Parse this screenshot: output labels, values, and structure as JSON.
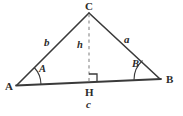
{
  "figure": {
    "stroke_color": "#3a3a3a",
    "dash_color": "#8a8a8a",
    "text_color": "#2b2b2b",
    "background": "#ffffff",
    "vertices": [
      {
        "name": "A",
        "label": "A",
        "x": 17,
        "y": 85
      },
      {
        "name": "C",
        "label": "C",
        "x": 89,
        "y": 13
      },
      {
        "name": "B",
        "label": "B",
        "x": 160,
        "y": 79
      },
      {
        "name": "H",
        "label": "H",
        "x": 89,
        "y": 83
      }
    ],
    "sides": [
      {
        "name": "side-b",
        "label": "b",
        "from": "A",
        "to": "C",
        "label_x": 46,
        "label_y": 43
      },
      {
        "name": "side-a",
        "label": "a",
        "from": "C",
        "to": "B",
        "label_x": 126,
        "label_y": 40
      },
      {
        "name": "side-c",
        "label": "c",
        "from": "A",
        "to": "B",
        "label_x": 87,
        "label_y": 103
      }
    ],
    "altitude": {
      "name": "altitude-h",
      "label": "h",
      "from": "C",
      "to": "H",
      "style": "dashed",
      "label_x": 79,
      "label_y": 45
    },
    "angles": [
      {
        "name": "angle-A",
        "label": "A",
        "at": "A",
        "label_x": 41,
        "label_y": 70
      },
      {
        "name": "angle-B",
        "label": "B",
        "at": "B",
        "label_x": 134,
        "label_y": 65
      }
    ],
    "right_angle": {
      "name": "right-angle-marker",
      "at": "H",
      "label": ""
    },
    "vertex_label_positions": {
      "A": {
        "x": 5,
        "y": 88
      },
      "C": {
        "x": 85,
        "y": 2
      },
      "B": {
        "x": 166,
        "y": 80
      },
      "H": {
        "x": 85,
        "y": 89
      }
    }
  }
}
